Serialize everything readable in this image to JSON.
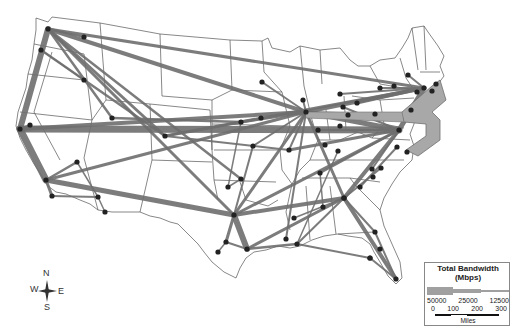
{
  "legend": {
    "title_line1": "Total Bandwidth",
    "title_line2": "(Mbps)",
    "bandwidth_values": [
      "50000",
      "25000",
      "12500"
    ],
    "distance_ticks": [
      "0",
      "100",
      "200",
      "300"
    ],
    "distance_unit": "Miles"
  },
  "compass": {
    "n": "N",
    "s": "S",
    "e": "E",
    "w": "W"
  },
  "colors": {
    "link": "#9a9a9a",
    "link_edge": "#6e6e6e",
    "node": "#222222",
    "border": "#555555"
  },
  "nodes": [
    {
      "id": "seattle",
      "x": 48,
      "y": 29
    },
    {
      "id": "spokane",
      "x": 84,
      "y": 37
    },
    {
      "id": "portland",
      "x": 41,
      "y": 50
    },
    {
      "id": "boise",
      "x": 84,
      "y": 80
    },
    {
      "id": "sacramento",
      "x": 30,
      "y": 125
    },
    {
      "id": "sf",
      "x": 20,
      "y": 129
    },
    {
      "id": "slc",
      "x": 112,
      "y": 118
    },
    {
      "id": "denver",
      "x": 165,
      "y": 136
    },
    {
      "id": "lasvegas",
      "x": 77,
      "y": 162
    },
    {
      "id": "la",
      "x": 46,
      "y": 180
    },
    {
      "id": "sandiego",
      "x": 52,
      "y": 196
    },
    {
      "id": "phoenix",
      "x": 98,
      "y": 197
    },
    {
      "id": "tucson",
      "x": 105,
      "y": 212
    },
    {
      "id": "kc",
      "x": 241,
      "y": 122
    },
    {
      "id": "omaha",
      "x": 261,
      "y": 118
    },
    {
      "id": "minneapolis",
      "x": 262,
      "y": 82
    },
    {
      "id": "chicago",
      "x": 306,
      "y": 112
    },
    {
      "id": "milwaukee",
      "x": 303,
      "y": 100
    },
    {
      "id": "stlouis",
      "x": 289,
      "y": 150
    },
    {
      "id": "tulsa",
      "x": 253,
      "y": 146
    },
    {
      "id": "okc",
      "x": 241,
      "y": 179
    },
    {
      "id": "dfw",
      "x": 234,
      "y": 215
    },
    {
      "id": "elpaso",
      "x": 228,
      "y": 187
    },
    {
      "id": "austin",
      "x": 226,
      "y": 242
    },
    {
      "id": "sanantonio",
      "x": 218,
      "y": 252
    },
    {
      "id": "houston",
      "x": 247,
      "y": 249
    },
    {
      "id": "memphis",
      "x": 320,
      "y": 173
    },
    {
      "id": "nashville",
      "x": 338,
      "y": 151
    },
    {
      "id": "atlanta",
      "x": 344,
      "y": 198
    },
    {
      "id": "birmingham",
      "x": 323,
      "y": 207
    },
    {
      "id": "jackson",
      "x": 294,
      "y": 218
    },
    {
      "id": "neworleans",
      "x": 297,
      "y": 244
    },
    {
      "id": "batonrouge",
      "x": 286,
      "y": 239
    },
    {
      "id": "tallahassee",
      "x": 370,
      "y": 258
    },
    {
      "id": "jacksonville",
      "x": 375,
      "y": 232
    },
    {
      "id": "orlando",
      "x": 380,
      "y": 249
    },
    {
      "id": "miami",
      "x": 396,
      "y": 279
    },
    {
      "id": "tampa",
      "x": 370,
      "y": 258
    },
    {
      "id": "charlotte",
      "x": 360,
      "y": 187
    },
    {
      "id": "raleigh",
      "x": 373,
      "y": 177
    },
    {
      "id": "greensboro",
      "x": 372,
      "y": 169
    },
    {
      "id": "durham",
      "x": 381,
      "y": 168
    },
    {
      "id": "columbia",
      "x": 344,
      "y": 198
    },
    {
      "id": "richmond",
      "x": 397,
      "y": 147
    },
    {
      "id": "norfolk",
      "x": 407,
      "y": 152
    },
    {
      "id": "dc",
      "x": 399,
      "y": 130
    },
    {
      "id": "baltimore",
      "x": 411,
      "y": 110
    },
    {
      "id": "philly",
      "x": 417,
      "y": 92
    },
    {
      "id": "nyc",
      "x": 424,
      "y": 88
    },
    {
      "id": "boston",
      "x": 436,
      "y": 84
    },
    {
      "id": "hartford",
      "x": 432,
      "y": 91
    },
    {
      "id": "albany",
      "x": 408,
      "y": 75
    },
    {
      "id": "pittsburgh",
      "x": 375,
      "y": 114
    },
    {
      "id": "cleveland",
      "x": 357,
      "y": 103
    },
    {
      "id": "detroit",
      "x": 343,
      "y": 107
    },
    {
      "id": "toledo",
      "x": 340,
      "y": 94
    },
    {
      "id": "columbus",
      "x": 348,
      "y": 115
    },
    {
      "id": "cincinnati",
      "x": 340,
      "y": 126
    },
    {
      "id": "indianapolis",
      "x": 318,
      "y": 130
    },
    {
      "id": "louisville",
      "x": 325,
      "y": 145
    },
    {
      "id": "buffalo",
      "x": 380,
      "y": 88
    },
    {
      "id": "rochester",
      "x": 394,
      "y": 86
    }
  ]
}
